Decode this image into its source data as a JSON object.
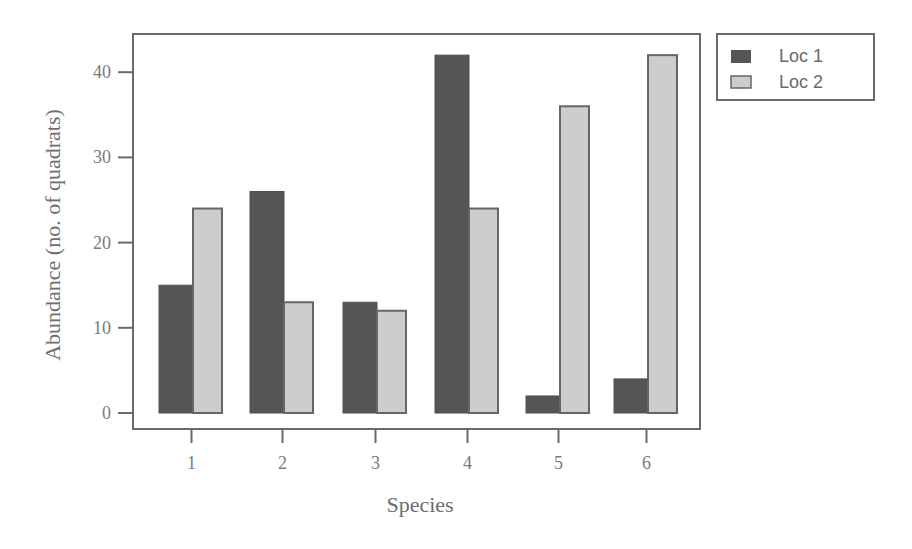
{
  "chart_data": {
    "type": "bar",
    "title": "",
    "xlabel": "Species",
    "ylabel": "Abundance (no. of quadrats)",
    "categories": [
      "1",
      "2",
      "3",
      "4",
      "5",
      "6"
    ],
    "series": [
      {
        "name": "Loc 1",
        "values": [
          15,
          26,
          13,
          42,
          2,
          4
        ],
        "color": "#555555"
      },
      {
        "name": "Loc 2",
        "values": [
          24,
          13,
          12,
          24,
          36,
          42
        ],
        "color": "#cccccc"
      }
    ],
    "ylim": [
      0,
      43
    ],
    "yticks": [
      0,
      10,
      20,
      30,
      40
    ],
    "grid": false,
    "legend_position": "outside-top-right"
  },
  "colors": {
    "axis": "#6a6a6a",
    "loc1_fill": "#555555",
    "loc2_fill": "#cdcdcd",
    "loc2_border": "#666666"
  }
}
